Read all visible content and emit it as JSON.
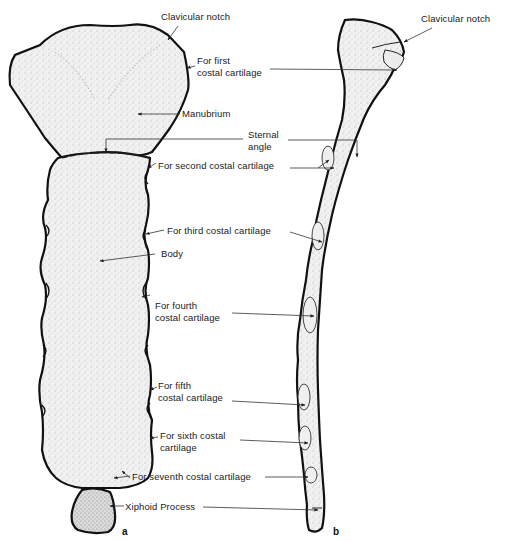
{
  "figure": {
    "panels": [
      {
        "id": "a",
        "letter": "a",
        "view": "anterior view of sternum"
      },
      {
        "id": "b",
        "letter": "b",
        "view": "lateral view of sternum"
      }
    ],
    "labels": {
      "clavicular_notch_a": "Clavicular notch",
      "first_costal_a": "For first\ncostal cartilage",
      "manubrium": "Manubrium",
      "sternal_angle": "Sternal\nangle",
      "second_costal": "For second costal cartilage",
      "third_costal": "For third costal cartilage",
      "body": "Body",
      "fourth_costal": "For fourth\ncostal cartilage",
      "fifth_costal": "For fifth\ncostal cartilage",
      "sixth_costal": "For sixth costal\ncartilage",
      "seventh_costal": "For seventh costal cartilage",
      "xiphoid": "Xiphoid Process",
      "clavicular_notch_b": "Clavicular notch"
    },
    "colors": {
      "outline": "#111111",
      "bone_fill": "#e9e9e9",
      "stipple": "#8a8a8a",
      "leader_line": "#333333",
      "background": "#ffffff"
    }
  }
}
